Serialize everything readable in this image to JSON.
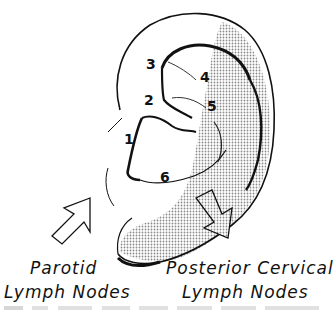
{
  "figure": {
    "regions": [
      {
        "id": "1",
        "label": "1"
      },
      {
        "id": "2",
        "label": "2"
      },
      {
        "id": "3",
        "label": "3"
      },
      {
        "id": "4",
        "label": "4"
      },
      {
        "id": "5",
        "label": "5"
      },
      {
        "id": "6",
        "label": "6"
      }
    ],
    "drainage_targets": [
      {
        "line1": "Parotid",
        "line2": "Lymph Nodes",
        "arrow_style": "outline"
      },
      {
        "line1": "Posterior Cervical",
        "line2": "Lymph Nodes",
        "arrow_style": "stippled"
      }
    ],
    "colors": {
      "ink": "#111111",
      "stipple": "#9a9a9a",
      "background": "#ffffff"
    }
  }
}
